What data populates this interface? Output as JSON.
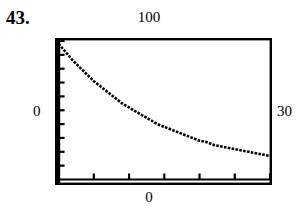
{
  "figure": {
    "problem_number": "43.",
    "caption_labels": {
      "top": "100",
      "left": "0",
      "right": "30",
      "bottom": "0"
    }
  },
  "chart_data": {
    "type": "line",
    "title": "",
    "subtitle": "",
    "xlabel": "",
    "ylabel": "",
    "xlim": [
      0,
      30
    ],
    "ylim": [
      0,
      100
    ],
    "grid": false,
    "legend": "none",
    "axis_style": "graphing-calculator-window",
    "frame": true,
    "tick_labels": {
      "x": [
        "0",
        "30"
      ],
      "y": [
        "0",
        "100"
      ]
    },
    "x_tick_count": 6,
    "x_tick_step": 5,
    "y_tick_count": 10,
    "y_tick_step": 10,
    "series": [
      {
        "name": "exponential decay",
        "style": "pixelated-dotted",
        "x": [
          0,
          1,
          2,
          3,
          4,
          5,
          6,
          7,
          8,
          9,
          10,
          11,
          12,
          13,
          14,
          15,
          16,
          17,
          18,
          19,
          20,
          21,
          22,
          23,
          24,
          25,
          26,
          27,
          28,
          29,
          30
        ],
        "y": [
          98,
          92,
          86,
          81,
          76,
          71,
          67,
          63,
          59,
          55,
          52,
          49,
          46,
          43,
          40,
          38,
          36,
          34,
          32,
          30,
          28,
          27,
          25,
          24,
          23,
          22,
          21,
          20,
          19,
          18,
          17
        ]
      }
    ]
  }
}
